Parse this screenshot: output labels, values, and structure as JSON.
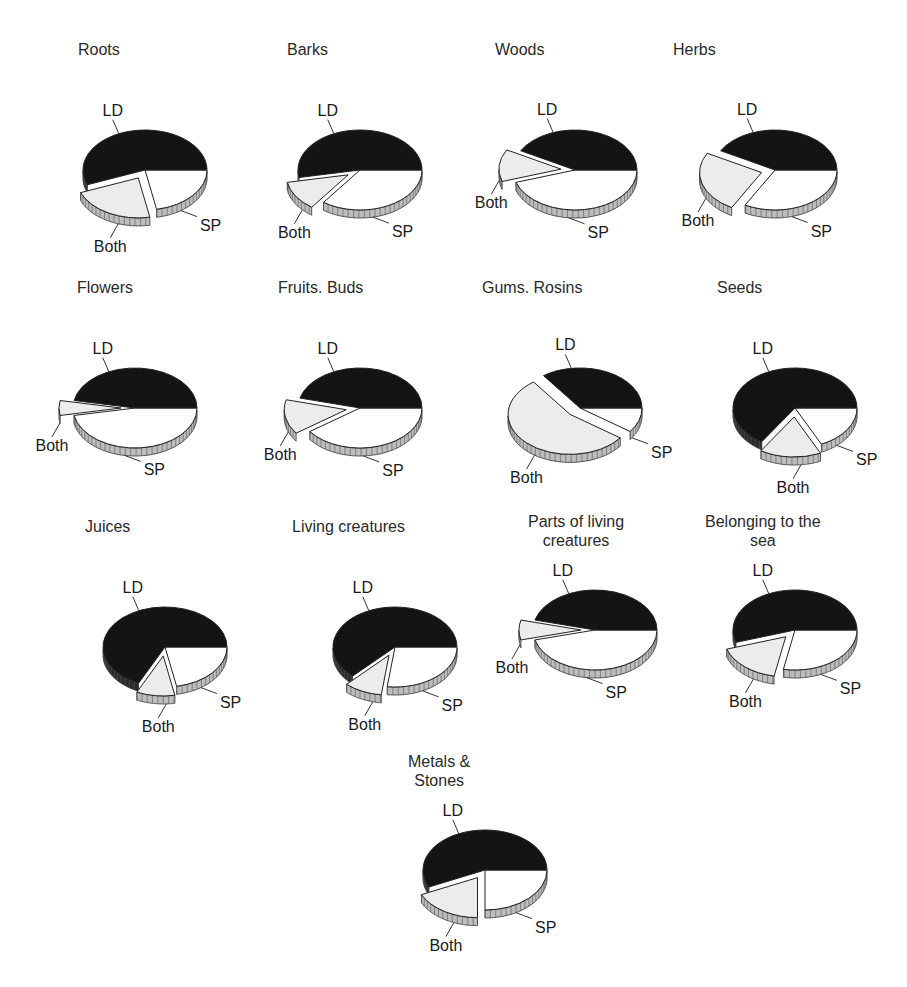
{
  "chart_data": [
    {
      "type": "pie",
      "title": "Roots",
      "categories": [
        "LD",
        "SP",
        "Both"
      ],
      "values": [
        56,
        22,
        22
      ]
    },
    {
      "type": "pie",
      "title": "Barks",
      "categories": [
        "LD",
        "SP",
        "Both"
      ],
      "values": [
        53,
        35,
        12
      ]
    },
    {
      "type": "pie",
      "title": "Woods",
      "categories": [
        "LD",
        "SP",
        "Both"
      ],
      "values": [
        42,
        45,
        13
      ]
    },
    {
      "type": "pie",
      "title": "Herbs",
      "categories": [
        "LD",
        "SP",
        "Both"
      ],
      "values": [
        42,
        33,
        25
      ]
    },
    {
      "type": "pie",
      "title": "Flowers",
      "categories": [
        "LD",
        "SP",
        "Both"
      ],
      "values": [
        47,
        47,
        6
      ]
    },
    {
      "type": "pie",
      "title": "Fruits. Buds",
      "categories": [
        "LD",
        "SP",
        "Both"
      ],
      "values": [
        46,
        40,
        14
      ]
    },
    {
      "type": "pie",
      "title": "Gums. Rosins",
      "categories": [
        "LD",
        "SP",
        "Both"
      ],
      "values": [
        35,
        10,
        55
      ]
    },
    {
      "type": "pie",
      "title": "Seeds",
      "categories": [
        "LD",
        "SP",
        "Both"
      ],
      "values": [
        66,
        18,
        16
      ]
    },
    {
      "type": "pie",
      "title": "Juices",
      "categories": [
        "LD",
        "SP",
        "Both"
      ],
      "values": [
        68,
        22,
        10
      ]
    },
    {
      "type": "pie",
      "title": "Living creatures",
      "categories": [
        "LD",
        "SP",
        "Both"
      ],
      "values": [
        63,
        27,
        10
      ]
    },
    {
      "type": "pie",
      "title": "Parts of living creatures",
      "categories": [
        "LD",
        "SP",
        "Both"
      ],
      "values": [
        46,
        46,
        8
      ]
    },
    {
      "type": "pie",
      "title": "Belonging to the sea",
      "categories": [
        "LD",
        "SP",
        "Both"
      ],
      "values": [
        55,
        28,
        17
      ]
    },
    {
      "type": "pie",
      "title": "Metals & Stones",
      "categories": [
        "LD",
        "SP",
        "Both"
      ],
      "values": [
        57,
        25,
        18
      ]
    }
  ],
  "legend": {
    "series_colors": {
      "LD": "#141414",
      "SP": "#ffffff",
      "Both": "#ececec"
    },
    "style": "3D exploded pie, LD dark, SP white, Both light gray"
  },
  "layout": [
    {
      "x": 40,
      "y": 40,
      "title_dx": 38,
      "title_lines": [
        "Roots"
      ]
    },
    {
      "x": 255,
      "y": 40,
      "title_dx": 32,
      "title_lines": [
        "Barks"
      ]
    },
    {
      "x": 470,
      "y": 40,
      "title_dx": 25,
      "title_lines": [
        "Woods"
      ]
    },
    {
      "x": 670,
      "y": 40,
      "title_dx": 3,
      "title_lines": [
        "Herbs"
      ]
    },
    {
      "x": 30,
      "y": 278,
      "title_dx": 47,
      "title_lines": [
        "Flowers"
      ]
    },
    {
      "x": 255,
      "y": 278,
      "title_dx": 23,
      "title_lines": [
        "Fruits. Buds"
      ]
    },
    {
      "x": 475,
      "y": 278,
      "title_dx": 7,
      "title_lines": [
        "Gums. Rosins"
      ]
    },
    {
      "x": 690,
      "y": 278,
      "title_dx": 27,
      "title_lines": [
        "Seeds"
      ]
    },
    {
      "x": 60,
      "y": 517,
      "title_dx": 25,
      "title_lines": [
        "Juices"
      ]
    },
    {
      "x": 290,
      "y": 517,
      "title_dx": 2,
      "title_lines": [
        "Living creatures"
      ]
    },
    {
      "x": 490,
      "y": 512,
      "title_dx": 38,
      "title_lines": [
        "Parts of living",
        "creatures"
      ]
    },
    {
      "x": 690,
      "y": 512,
      "title_dx": 15,
      "title_lines": [
        "Belonging to the",
        "sea"
      ]
    },
    {
      "x": 380,
      "y": 752,
      "title_dx": 28,
      "title_lines": [
        "Metals &",
        "Stones"
      ]
    }
  ],
  "labels": {
    "ld": "LD",
    "sp": "SP",
    "both": "Both"
  }
}
